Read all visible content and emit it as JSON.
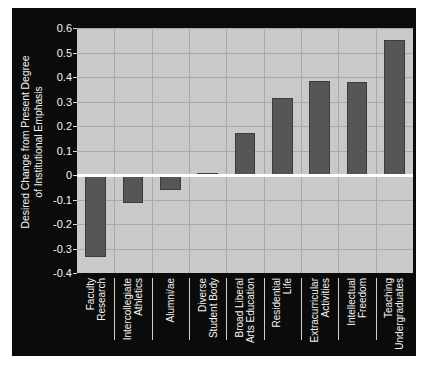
{
  "chart_data": {
    "type": "bar",
    "title": "",
    "subtitle": "",
    "xlabel": "",
    "ylabel": "Desired Change from Present Degree of Institutional Emphasis",
    "ylabel_lines": [
      "Desired Change from Present Degree",
      "of Institutional Emphasis"
    ],
    "categories": [
      "Faculty Research",
      "Intercollegiate Athletics",
      "Alumni/ae",
      "Diverse Student Body",
      "Broad Liberal Arts Education",
      "Residential Life",
      "Extracurricular Activities",
      "Intellectual Freedom",
      "Teaching Undergraduates"
    ],
    "category_lines": [
      [
        "Faculty",
        "Research"
      ],
      [
        "Intercollegiate",
        "Athletics"
      ],
      [
        "Alumni/ae"
      ],
      [
        "Diverse",
        "Student Body"
      ],
      [
        "Broad Liberal",
        "Arts Education"
      ],
      [
        "Residential",
        "Life"
      ],
      [
        "Extracurricular",
        "Activities"
      ],
      [
        "Intellectual",
        "Freedom"
      ],
      [
        "Teaching",
        "Undergraduates"
      ]
    ],
    "values": [
      -0.335,
      -0.115,
      -0.06,
      0.01,
      0.17,
      0.315,
      0.385,
      0.38,
      0.55
    ],
    "ylim": [
      -0.4,
      0.6
    ],
    "yticks": [
      0.6,
      0.5,
      0.4,
      0.3,
      0.2,
      0.1,
      0,
      -0.1,
      -0.2,
      -0.3,
      -0.4
    ],
    "ytick_labels": [
      "0.6",
      "0.5",
      "0.4",
      "0.3",
      "0.2",
      "0.1",
      "0",
      "-0.1",
      "-0.2",
      "-0.3",
      "-0.4"
    ],
    "grid": true,
    "legend": "none",
    "zero_reference_line": true,
    "colors": {
      "figure_background": "#0b0b0b",
      "plot_background": "#c9c9c9",
      "bar": "#565656",
      "gridline": "#a8a8a8",
      "zero_line": "#ffffff",
      "text": "#f4f4f4"
    }
  }
}
